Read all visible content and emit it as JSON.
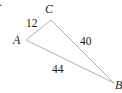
{
  "figure": {
    "fragment": ".",
    "vertices": [
      {
        "name": "A",
        "x": 26,
        "y": 40,
        "label_x": 13,
        "label_y": 44
      },
      {
        "name": "C",
        "x": 51,
        "y": 20,
        "label_x": 45,
        "label_y": 13
      },
      {
        "name": "B",
        "x": 114,
        "y": 83,
        "label_x": 115,
        "label_y": 89
      }
    ],
    "sides": [
      {
        "between": "AC",
        "length": "12"
      },
      {
        "between": "CB",
        "length": "40"
      },
      {
        "between": "AB",
        "length": "44"
      }
    ],
    "stroke_color": "#b0b0b0",
    "text_color": "#1a1a1a"
  }
}
